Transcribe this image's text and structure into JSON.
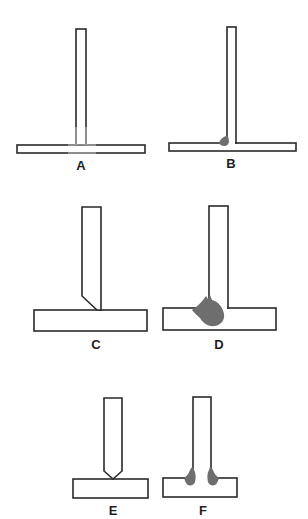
{
  "figure": {
    "type": "T-joint welding diagrams",
    "colors": {
      "outline": "#2a2a2a",
      "weld": "#6e6e6e",
      "faded_outline": "#c8c8c8",
      "background": "#ffffff"
    },
    "panels": [
      {
        "id": "A",
        "label": "A",
        "description": "thin square-edge T-joint, no weld shown (faded junction)"
      },
      {
        "id": "B",
        "label": "B",
        "description": "thin T-joint with small single fillet weld on left"
      },
      {
        "id": "C",
        "label": "C",
        "description": "thick T-joint with single bevel on left of vertical plate"
      },
      {
        "id": "D",
        "label": "D",
        "description": "thick T-joint with single-sided weld on left"
      },
      {
        "id": "E",
        "label": "E",
        "description": "T-joint with double bevel (pointed) vertical plate"
      },
      {
        "id": "F",
        "label": "F",
        "description": "T-joint with double-sided welds"
      }
    ]
  }
}
